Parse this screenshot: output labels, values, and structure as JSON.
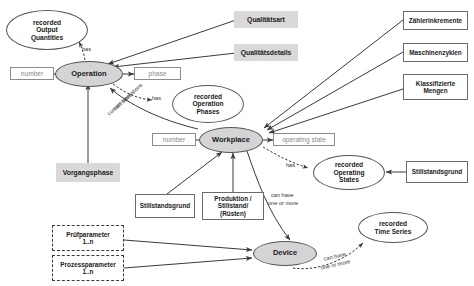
{
  "diagram": {
    "colors": {
      "entity_fill": "#d4d4d4",
      "gray_box_fill": "#d9d9d9",
      "stroke": "#555555",
      "attr_text": "#8a8a8a",
      "background": "#ffffff"
    },
    "nodes": {
      "recorded_output_quantities": "recorded\nOutput\nQuantities",
      "recorded_output_quantities_l1": "recorded",
      "recorded_output_quantities_l2": "Output",
      "recorded_output_quantities_l3": "Quantities",
      "number_operation": "number",
      "operation": "Operation",
      "phase": "phase",
      "qualitaetsart": "Qualitätsart",
      "qualitaetsdetails": "Qualitätsdetails",
      "zaehlerinkremente": "Zählerinkremente",
      "maschinenzyklen": "Maschinenzyklen",
      "klassifizierte_mengen_l1": "Klassifizierte",
      "klassifizierte_mengen_l2": "Mengen",
      "recorded_operation_phases_l1": "recorded",
      "recorded_operation_phases_l2": "Operation",
      "recorded_operation_phases_l3": "Phases",
      "number_workplace": "number",
      "workplace": "Workplace",
      "operating_state": "operating state",
      "recorded_operating_states_l1": "recorded",
      "recorded_operating_states_l2": "Operating",
      "recorded_operating_states_l3": "States",
      "stillstandsgrund_right": "Stillstandsgrund",
      "vorgangsphase": "Vorgangsphase",
      "stillstandsgrund_mid": "Stillstandsgrund",
      "produktion_l1": "Produktion /",
      "produktion_l2": "Stillstand/",
      "produktion_l3": "(Rüsten)",
      "pruefparameter_l1": "Prüfparameter",
      "pruefparameter_l2": "1..n",
      "prozessparameter_l1": "Prozessparameter",
      "prozessparameter_l2": "1..n",
      "device": "Device",
      "recorded_time_series_l1": "recorded",
      "recorded_time_series_l2": "Time Series"
    },
    "edge_labels": {
      "has_output_quantities": "has",
      "has_operation_phases": "has",
      "can_have_current_operations_l1": "can have",
      "can_have_current_operations_l2": "current operations",
      "has_operating_states": "has",
      "can_have_one_or_more_device_l1": "can have",
      "can_have_one_or_more_device_l2": "one or more",
      "can_have_one_or_more_timeseries_l1": "can have",
      "can_have_one_or_more_timeseries_l2": "one or more"
    }
  }
}
